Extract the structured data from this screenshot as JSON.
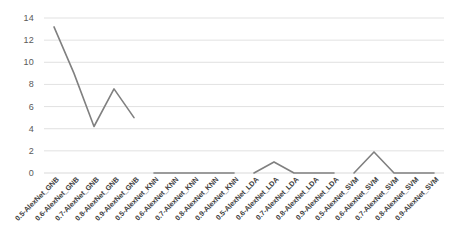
{
  "chart_data": {
    "type": "line",
    "title": "",
    "subtitle": "",
    "xlabel": "",
    "ylabel": "",
    "grid": true,
    "grid_axis": "y",
    "legend": false,
    "legend_position": "none",
    "line_color": "#808080",
    "gridline_color": "#d9d9d9",
    "axis_label_color": "#595959",
    "ylim": [
      0,
      14
    ],
    "yticks": [
      0,
      2,
      4,
      6,
      8,
      10,
      12,
      14
    ],
    "ytick_labels": [
      "0",
      "2",
      "4",
      "6",
      "8",
      "10",
      "12",
      "14"
    ],
    "categories": [
      "0.5-AlexNet_GNB",
      "0.6-AlexNet_GNB",
      "0.7-AlexNet_GNB",
      "0.8-AlexNet_GNB",
      "0.9-AlexNet_GNB",
      "0.5-AlexNet_KNN",
      "0.6-AlexNet_KNN",
      "0.7-AlexNet_KNN",
      "0.8-AlexNet_KNN",
      "0.9-AlexNet_KNN",
      "0.5-AlexNet_LDA",
      "0.6-AlexNet_LDA",
      "0.7-AlexNet_LDA",
      "0.8-AlexNet_LDA",
      "0.9-AlexNet_LDA",
      "0.5-AlexNet_SVM",
      "0.6-AlexNet_SVM",
      "0.7-AlexNet_SVM",
      "0.8-AlexNet_SVM",
      "0.9-AlexNet_SVM"
    ],
    "values": [
      13.2,
      9.0,
      4.2,
      7.6,
      5.0,
      0.0,
      0.0,
      0.0,
      0.0,
      0.0,
      0.0,
      1.0,
      0.0,
      0.0,
      0.0,
      0.0,
      1.9,
      0.0,
      0.0,
      0.0
    ],
    "groups": [
      {
        "name": "GNB",
        "start_index": 0,
        "end_index": 4
      },
      {
        "name": "KNN",
        "start_index": 5,
        "end_index": 9
      },
      {
        "name": "LDA",
        "start_index": 10,
        "end_index": 14
      },
      {
        "name": "SVM",
        "start_index": 15,
        "end_index": 19
      }
    ]
  }
}
